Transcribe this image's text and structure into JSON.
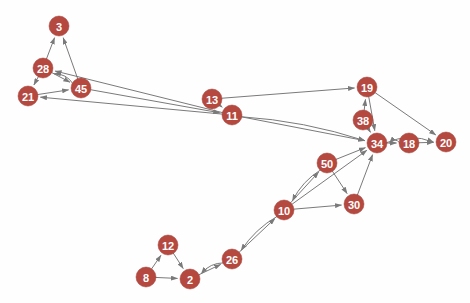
{
  "graph": {
    "title": "",
    "background_color": "#fefefe",
    "node_color": "#b5493f",
    "node_label_color": "#ffffff",
    "edge_color": "#7a7a7a",
    "node_radius": 10,
    "directed": true,
    "nodes": [
      {
        "id": "3",
        "label": "3",
        "x": 59,
        "y": 26
      },
      {
        "id": "28",
        "label": "28",
        "x": 43,
        "y": 68
      },
      {
        "id": "21",
        "label": "21",
        "x": 28,
        "y": 96
      },
      {
        "id": "45",
        "label": "45",
        "x": 81,
        "y": 88
      },
      {
        "id": "13",
        "label": "13",
        "x": 212,
        "y": 99
      },
      {
        "id": "11",
        "label": "11",
        "x": 232,
        "y": 115
      },
      {
        "id": "19",
        "label": "19",
        "x": 367,
        "y": 87
      },
      {
        "id": "38",
        "label": "38",
        "x": 363,
        "y": 120
      },
      {
        "id": "34",
        "label": "34",
        "x": 377,
        "y": 143
      },
      {
        "id": "18",
        "label": "18",
        "x": 409,
        "y": 143
      },
      {
        "id": "20",
        "label": "20",
        "x": 446,
        "y": 142
      },
      {
        "id": "50",
        "label": "50",
        "x": 327,
        "y": 163
      },
      {
        "id": "30",
        "label": "30",
        "x": 354,
        "y": 204
      },
      {
        "id": "10",
        "label": "10",
        "x": 284,
        "y": 210
      },
      {
        "id": "26",
        "label": "26",
        "x": 232,
        "y": 259
      },
      {
        "id": "12",
        "label": "12",
        "x": 168,
        "y": 245
      },
      {
        "id": "8",
        "label": "8",
        "x": 146,
        "y": 277
      },
      {
        "id": "2",
        "label": "2",
        "x": 190,
        "y": 279
      }
    ],
    "edges": [
      {
        "source": "28",
        "target": "3",
        "curve": 0
      },
      {
        "source": "45",
        "target": "3",
        "curve": 0
      },
      {
        "source": "28",
        "target": "21",
        "curve": 0
      },
      {
        "source": "28",
        "target": "45",
        "curve": 0
      },
      {
        "source": "21",
        "target": "45",
        "curve": 0
      },
      {
        "source": "45",
        "target": "28",
        "curve": 3
      },
      {
        "source": "11",
        "target": "28",
        "curve": 0
      },
      {
        "source": "11",
        "target": "21",
        "curve": 0
      },
      {
        "source": "45",
        "target": "11",
        "curve": 0
      },
      {
        "source": "13",
        "target": "11",
        "curve": 0
      },
      {
        "source": "13",
        "target": "19",
        "curve": 0
      },
      {
        "source": "11",
        "target": "34",
        "curve": 0
      },
      {
        "source": "11",
        "target": "34",
        "curve": -4
      },
      {
        "source": "19",
        "target": "34",
        "curve": 0
      },
      {
        "source": "19",
        "target": "20",
        "curve": 0
      },
      {
        "source": "38",
        "target": "19",
        "curve": 0
      },
      {
        "source": "38",
        "target": "34",
        "curve": 0
      },
      {
        "source": "34",
        "target": "18",
        "curve": 0
      },
      {
        "source": "18",
        "target": "34",
        "curve": 3
      },
      {
        "source": "18",
        "target": "20",
        "curve": 0
      },
      {
        "source": "34",
        "target": "20",
        "curve": -5
      },
      {
        "source": "50",
        "target": "34",
        "curve": 0
      },
      {
        "source": "50",
        "target": "30",
        "curve": 0
      },
      {
        "source": "30",
        "target": "34",
        "curve": 0
      },
      {
        "source": "10",
        "target": "50",
        "curve": 0
      },
      {
        "source": "50",
        "target": "10",
        "curve": 3
      },
      {
        "source": "10",
        "target": "30",
        "curve": 0
      },
      {
        "source": "10",
        "target": "34",
        "curve": 0
      },
      {
        "source": "26",
        "target": "10",
        "curve": 0
      },
      {
        "source": "10",
        "target": "26",
        "curve": 3
      },
      {
        "source": "8",
        "target": "12",
        "curve": 0
      },
      {
        "source": "12",
        "target": "2",
        "curve": 0
      },
      {
        "source": "8",
        "target": "2",
        "curve": 0
      },
      {
        "source": "2",
        "target": "26",
        "curve": 0
      },
      {
        "source": "26",
        "target": "2",
        "curve": 3
      }
    ]
  }
}
